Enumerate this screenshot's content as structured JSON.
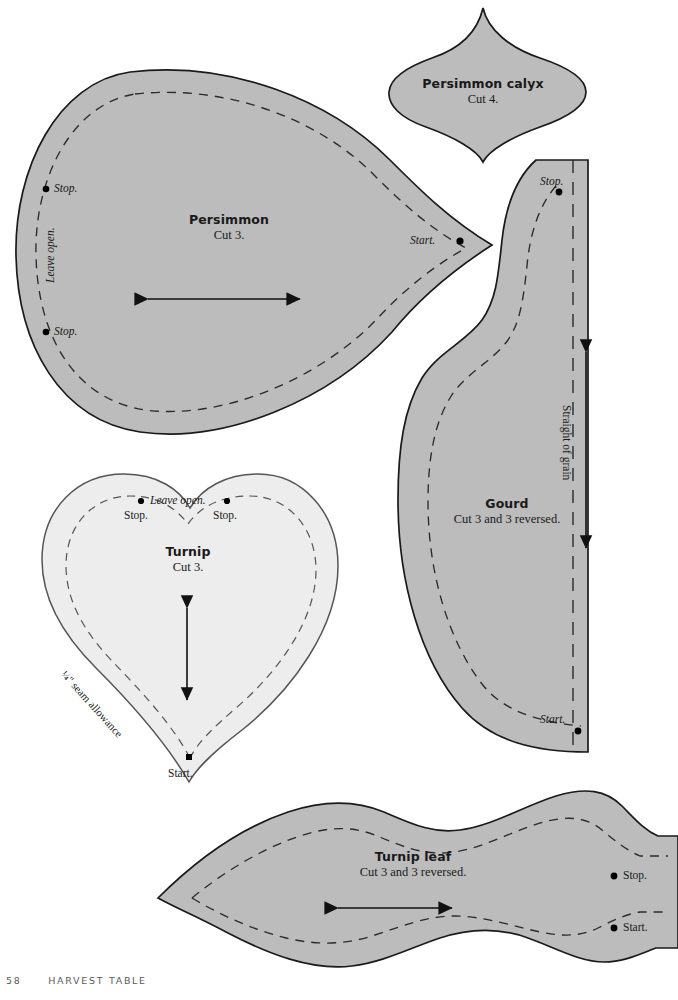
{
  "page": {
    "number": "58",
    "running_head": "HARVEST TABLE",
    "background_color": "#ffffff"
  },
  "style": {
    "fill_gray_dark": "#bcbcbc",
    "fill_gray_light": "#ededed",
    "outline_color": "#1a1a1a",
    "dash_color": "#2b2b2b",
    "dot_color": "#000000"
  },
  "patterns": [
    {
      "id": "persimmon",
      "title": "Persimmon",
      "cut": "Cut 3.",
      "fill": "#bcbcbc",
      "markers": [
        {
          "name": "stop-upper",
          "label": "Stop."
        },
        {
          "name": "stop-lower",
          "label": "Stop."
        },
        {
          "name": "start",
          "label": "Start."
        }
      ],
      "notes": [
        {
          "name": "leave-open",
          "label": "Leave open.",
          "rotation": "-90"
        }
      ],
      "grain_arrow": "horizontal-double"
    },
    {
      "id": "persimmon-calyx",
      "title": "Persimmon calyx",
      "cut": "Cut 4.",
      "fill": "#bcbcbc",
      "markers": [],
      "notes": [],
      "grain_arrow": "none"
    },
    {
      "id": "gourd",
      "title": "Gourd",
      "cut": "Cut 3 and 3 reversed.",
      "fill": "#bcbcbc",
      "markers": [
        {
          "name": "stop",
          "label": "Stop."
        },
        {
          "name": "start",
          "label": "Start."
        }
      ],
      "notes": [
        {
          "name": "straight-of-grain",
          "label": "Straight of grain",
          "rotation": "90"
        }
      ],
      "grain_arrow": "vertical-double"
    },
    {
      "id": "turnip",
      "title": "Turnip",
      "cut": "Cut 3.",
      "fill": "#ededed",
      "markers": [
        {
          "name": "stop-left",
          "label": "Stop."
        },
        {
          "name": "stop-right",
          "label": "Stop."
        },
        {
          "name": "start",
          "label": "Start."
        }
      ],
      "notes": [
        {
          "name": "leave-open",
          "label": "Leave open.",
          "rotation": "0"
        },
        {
          "name": "seam-allowance",
          "label": "¼\" seam allowance",
          "rotation": "48"
        }
      ],
      "grain_arrow": "vertical-double"
    },
    {
      "id": "turnip-leaf",
      "title": "Turnip leaf",
      "cut": "Cut 3 and 3 reversed.",
      "fill": "#bcbcbc",
      "markers": [
        {
          "name": "stop",
          "label": "Stop."
        },
        {
          "name": "start",
          "label": "Start."
        }
      ],
      "notes": [],
      "grain_arrow": "horizontal-double"
    }
  ]
}
